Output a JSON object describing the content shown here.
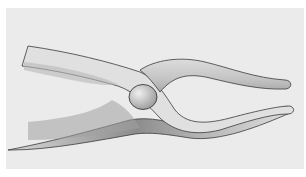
{
  "image": {
    "subject": "pencil illustration of tongs / pliers",
    "colors": {
      "background": "#ebebeb",
      "margin": "#ffffff",
      "metal_light": "#e4e4e4",
      "metal_shade": "#9a9a9a",
      "outline": "#3a3a3a"
    }
  }
}
